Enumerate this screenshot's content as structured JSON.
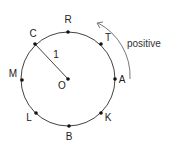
{
  "diagram": {
    "center": {
      "label": "O",
      "x": 68,
      "y": 79
    },
    "radius_px": 47,
    "radius_label": "1",
    "direction_label": "positive",
    "colors": {
      "circle": "#444444",
      "points": "#111111",
      "arrow": "#777777",
      "text": "#222222"
    },
    "points": [
      {
        "label": "R",
        "x": 68,
        "y": 32,
        "lx": 68,
        "ly": 23
      },
      {
        "label": "T",
        "x": 101,
        "y": 44,
        "lx": 108,
        "ly": 41
      },
      {
        "label": "A",
        "x": 115,
        "y": 79,
        "lx": 122,
        "ly": 83
      },
      {
        "label": "K",
        "x": 101,
        "y": 113,
        "lx": 108,
        "ly": 121
      },
      {
        "label": "B",
        "x": 69,
        "y": 126,
        "lx": 69,
        "ly": 140
      },
      {
        "label": "L",
        "x": 36,
        "y": 113,
        "lx": 29,
        "ly": 121
      },
      {
        "label": "M",
        "x": 22,
        "y": 80,
        "lx": 13,
        "ly": 77
      },
      {
        "label": "C",
        "x": 35,
        "y": 44,
        "lx": 33,
        "ly": 37
      }
    ]
  }
}
